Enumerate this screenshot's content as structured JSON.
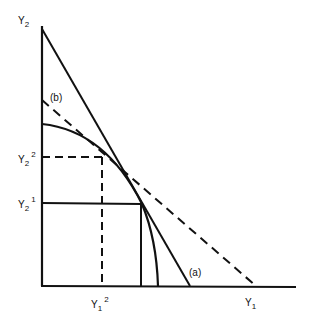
{
  "diagram": {
    "axes": {
      "y_axis_label": {
        "base": "Y",
        "sub": "2"
      },
      "x_axis_label": {
        "base": "Y",
        "sub": "1"
      }
    },
    "line_labels": {
      "solid_line": "(a)",
      "dashed_line": "(b)"
    },
    "ticks": {
      "y2_2": {
        "base": "Y",
        "sub": "2",
        "sup": "2"
      },
      "y2_1": {
        "base": "Y",
        "sub": "2",
        "sup": "1"
      },
      "y1_2": {
        "base": "Y",
        "sub": "1",
        "sup": "2"
      }
    },
    "colors": {
      "ink": "#111111",
      "background": "#ffffff"
    }
  }
}
